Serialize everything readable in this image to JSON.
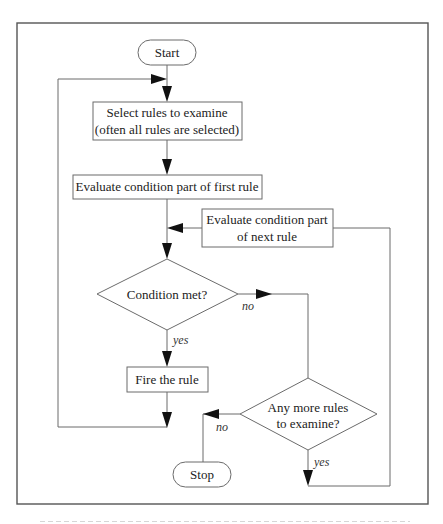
{
  "diagram": {
    "type": "flowchart",
    "nodes": {
      "start": "Start",
      "select_rules_line1": "Select rules to examine",
      "select_rules_line2": "(often all rules are selected)",
      "evaluate_first": "Evaluate condition part of first rule",
      "evaluate_next_line1": "Evaluate condition part",
      "evaluate_next_line2": "of next rule",
      "condition_met": "Condition met?",
      "fire_rule": "Fire the rule",
      "more_rules_line1": "Any more rules",
      "more_rules_line2": "to examine?",
      "stop": "Stop"
    },
    "edge_labels": {
      "condition_no": "no",
      "condition_yes": "yes",
      "more_no": "no",
      "more_yes": "yes"
    },
    "edges": [
      [
        "start",
        "select_rules"
      ],
      [
        "select_rules",
        "evaluate_first"
      ],
      [
        "evaluate_first",
        "condition_met"
      ],
      [
        "evaluate_next",
        "condition_met"
      ],
      [
        "condition_met",
        "fire_rule",
        "yes"
      ],
      [
        "condition_met",
        "more_rules",
        "no"
      ],
      [
        "fire_rule",
        "select_rules"
      ],
      [
        "more_rules",
        "stop",
        "no"
      ],
      [
        "more_rules",
        "evaluate_next",
        "yes"
      ]
    ],
    "colors": {
      "line": "#6b6b6b",
      "arrowhead": "#111111",
      "frame": "#555555",
      "background": "#ffffff"
    }
  }
}
